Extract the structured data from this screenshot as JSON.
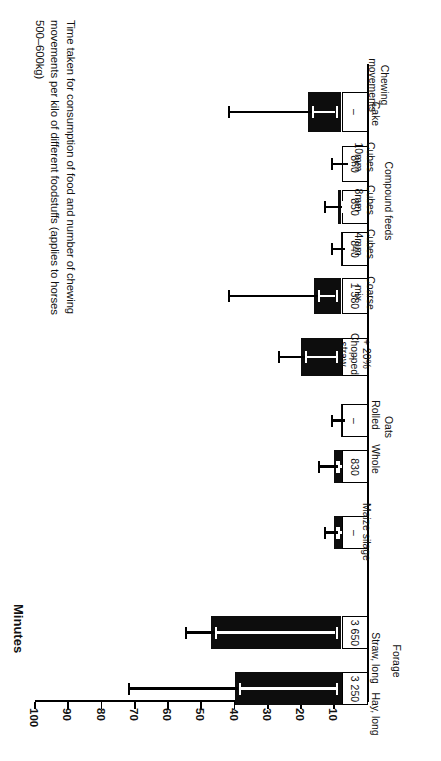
{
  "chart_data": {
    "type": "bar",
    "orientation": "horizontal",
    "title": "Time taken for consumption of food and number of chewing\nmovements per kilo of different foodstuffs (applies to horses\n500–600kg)",
    "xlabel": "Minutes",
    "ylabel": "",
    "value_axis_label": "Minutes",
    "value_axis_ticks": [
      100,
      90,
      80,
      70,
      60,
      50,
      40,
      30,
      20,
      10
    ],
    "value_axis_tick_labels": [
      "100",
      "90",
      "80",
      "70",
      "60",
      "50",
      "40",
      "30",
      "20",
      "10"
    ],
    "xlim": [
      0,
      100
    ],
    "grid": false,
    "legend": null,
    "secondary_axis_header": "Chewing\nmovements",
    "categories": [
      "Hay, long",
      "Straw, long",
      "Maize silage",
      "Whole",
      "Rolled",
      "+ 20%\nChopped\nstraw",
      "Coarse\nmix",
      "Cubes\n4mm",
      "Cubes\n8mm",
      "Cubes\n10mm",
      "Cake"
    ],
    "groups": [
      {
        "label": "Forage",
        "members": [
          "Hay, long",
          "Straw, long",
          "Maize silage"
        ]
      },
      {
        "label": "Oats",
        "members": [
          "Whole",
          "Rolled"
        ]
      },
      {
        "label": "Compound feeds",
        "members": [
          "Cubes\n4mm",
          "Cubes\n8mm",
          "Cubes\n10mm"
        ]
      }
    ],
    "values": [
      40,
      47,
      10,
      10,
      8,
      20,
      16,
      8,
      9,
      7,
      18
    ],
    "error_high": [
      72,
      55,
      13,
      15,
      11,
      27,
      42,
      11,
      13,
      11,
      42
    ],
    "chewing_movements": [
      "3 250",
      "3 650",
      "–",
      "830",
      "–",
      "–",
      "1 380",
      "840",
      "850",
      "860",
      "–"
    ],
    "units": "minutes per kilo"
  },
  "axis": {
    "minutes_label": "Minutes",
    "ticks": [
      "100",
      "90",
      "80",
      "70",
      "60",
      "50",
      "40",
      "30",
      "20",
      "10"
    ]
  },
  "labels": {
    "chewing_header": "Chewing\nmovements",
    "forage": "Forage",
    "oats": "Oats",
    "compound_feeds": "Compound feeds",
    "hay_long": "Hay, long",
    "straw_long": "Straw, long",
    "maize_silage": "Maize silage",
    "whole": "Whole",
    "rolled": "Rolled",
    "chopped_straw": "+ 20%\nChopped\nstraw",
    "coarse_mix": "Coarse\nmix",
    "cubes_4mm": "Cubes\n4mm",
    "cubes_8mm": "Cubes\n8mm",
    "cubes_10mm": "Cubes\n10mm",
    "cake": "Cake"
  },
  "values_text": {
    "hay_long": "3 250",
    "straw_long": "3 650",
    "maize_silage": "–",
    "whole": "830",
    "rolled": "–",
    "chopped_straw": "–",
    "coarse_mix": "1 380",
    "cubes_4mm": "840",
    "cubes_8mm": "850",
    "cubes_10mm": "860",
    "cake": "–"
  },
  "colors": {
    "bar": "#0d0d0d",
    "background": "#ffffff",
    "text": "#111111",
    "error_inner": "#ffffff"
  }
}
